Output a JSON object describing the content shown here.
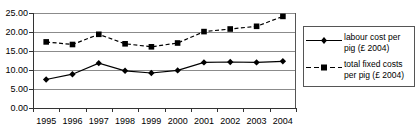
{
  "chart_data": {
    "type": "line",
    "title": "",
    "xlabel": "",
    "ylabel": "",
    "categories": [
      "1995",
      "1996",
      "1997",
      "1998",
      "1999",
      "2000",
      "2001",
      "2002",
      "2003",
      "2004"
    ],
    "ylim": [
      0.0,
      25.0
    ],
    "yticks": [
      "0.00",
      "5.00",
      "10.00",
      "15.00",
      "20.00",
      "25.00"
    ],
    "ytick_values": [
      0.0,
      5.0,
      10.0,
      15.0,
      20.0,
      25.0
    ],
    "grid": "horizontal",
    "legend_position": "right-outside",
    "series": [
      {
        "name": "labour cost per pig (£ 2004)",
        "marker": "diamond",
        "line_style": "solid",
        "color": "#000000",
        "values": [
          7.5,
          8.9,
          11.8,
          9.8,
          9.2,
          9.9,
          12.0,
          12.1,
          12.0,
          12.3
        ]
      },
      {
        "name": "total fixed costs per pig (£ 2004)",
        "marker": "square",
        "line_style": "dashed",
        "color": "#000000",
        "values": [
          17.4,
          16.7,
          19.4,
          16.9,
          16.1,
          17.1,
          20.1,
          20.8,
          21.5,
          24.1
        ]
      }
    ]
  },
  "legend": {
    "entries": [
      {
        "label": "labour cost per\npig (£ 2004)",
        "marker": "diamond-marker-icon",
        "line_style": "solid"
      },
      {
        "label": "total fixed costs\nper pig (£ 2004)",
        "marker": "square-marker-icon",
        "line_style": "dashed"
      }
    ]
  }
}
